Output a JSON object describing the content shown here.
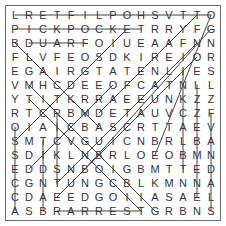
{
  "puzzle": {
    "rows": [
      "LRETFILPOHSVTTO",
      "PICKPOCKETRRYFG",
      "BDUARFOIUEAAFNN",
      "FLVFEOSDKIREIOR",
      "EGAIRGTATENLIES",
      "VMHCDEEOFCATNLL",
      "YTITKRRAEEUNKZZ",
      "RTCRBMDETAUVCZF",
      "OIAICBASCRTTAEV",
      "SMTCVGUICNBRLBA",
      "SDIKLNBRLOEOBMN",
      "EDDSNBOIGBMTTED",
      "CGNTUNGCBLKMNNA",
      "CDAEEDGOIIASAEL",
      "ASBRARRESTGRBNS"
    ],
    "found_lines": [
      {
        "r1": 0,
        "c1": 0,
        "r2": 0,
        "c2": 14
      },
      {
        "r1": 1,
        "c1": 0,
        "r2": 1,
        "c2": 9
      },
      {
        "r1": 2,
        "c1": 1,
        "r2": 2,
        "c2": 5
      },
      {
        "r1": 14,
        "c1": 3,
        "r2": 14,
        "c2": 9
      },
      {
        "r1": 2,
        "c1": 0,
        "r2": 8,
        "c2": 6
      },
      {
        "r1": 7,
        "c1": 3,
        "r2": 14,
        "c2": 10
      },
      {
        "r1": 9,
        "c1": 0,
        "r2": 1,
        "c2": 8
      },
      {
        "r1": 11,
        "c1": 5,
        "r2": 1,
        "c2": 14
      },
      {
        "r1": 3,
        "c1": 12,
        "r2": 11,
        "c2": 4
      },
      {
        "r1": 10,
        "c1": 10,
        "r2": 0,
        "c2": 14
      },
      {
        "r1": 8,
        "c1": 0,
        "r2": 14,
        "c2": 0
      },
      {
        "r1": 9,
        "c1": 2,
        "r2": 14,
        "c2": 2
      },
      {
        "r1": 7,
        "c1": 3,
        "r2": 12,
        "c2": 3
      },
      {
        "r1": 4,
        "c1": 12,
        "r2": 11,
        "c2": 12
      },
      {
        "r1": 6,
        "c1": 1,
        "r2": 14,
        "c2": 9
      },
      {
        "r1": 5,
        "c1": 13,
        "r2": 13,
        "c2": 13
      },
      {
        "r1": 7,
        "c1": 14,
        "r2": 14,
        "c2": 14
      },
      {
        "r1": 0,
        "c1": 13,
        "r2": 7,
        "c2": 6
      },
      {
        "r1": 2,
        "c1": 13,
        "r2": 12,
        "c2": 3
      },
      {
        "r1": 3,
        "c1": 13,
        "r2": 13,
        "c2": 3
      },
      {
        "r1": 5,
        "c1": 1,
        "r2": 12,
        "c2": 8
      },
      {
        "r1": 11,
        "c1": 1,
        "r2": 5,
        "c2": 7
      }
    ]
  }
}
